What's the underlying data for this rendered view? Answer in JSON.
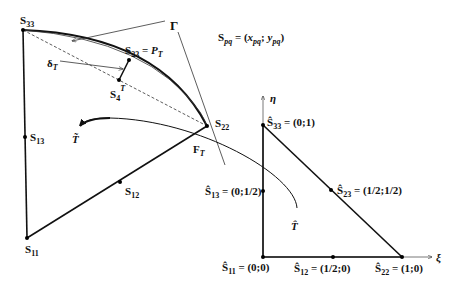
{
  "legend": {
    "formula_S": "S",
    "formula_sub": "pq",
    "formula_eq": " = (",
    "formula_x": "x",
    "formula_xsub": "pq",
    "formula_sep": "; ",
    "formula_y": "y",
    "formula_ysub": "pq",
    "formula_close": ")"
  },
  "physical": {
    "S33": {
      "base": "S",
      "sub": "33"
    },
    "S13": {
      "base": "S",
      "sub": "13"
    },
    "S11": {
      "base": "S",
      "sub": "11"
    },
    "S12": {
      "base": "S",
      "sub": "12"
    },
    "S22": {
      "base": "S",
      "sub": "22"
    },
    "S23": {
      "base": "S",
      "sub": "23",
      "eq": " = ",
      "P": "P",
      "Psub": "T"
    },
    "S4T": {
      "base": "S",
      "sub": "4",
      "sup": "T"
    },
    "deltaT": {
      "base": "δ",
      "sub": "T"
    },
    "gamma": "Γ",
    "FT": {
      "base": "F",
      "sub": "T"
    },
    "Ttilde": "T̃"
  },
  "reference": {
    "eta": "η",
    "xi": "ξ",
    "That": "T̂",
    "S33": {
      "base": "Ŝ",
      "sub": "33",
      "value": " = (0;1)"
    },
    "S13": {
      "base": "Ŝ",
      "sub": "13",
      "value": " = (0;1/2)"
    },
    "S23": {
      "base": "Ŝ",
      "sub": "23",
      "value": " = (1/2;1/2)"
    },
    "S11": {
      "base": "Ŝ",
      "sub": "11",
      "value": " = (0;0)"
    },
    "S12": {
      "base": "Ŝ",
      "sub": "12",
      "value": " = (1/2;0)"
    },
    "S22": {
      "base": "Ŝ",
      "sub": "22",
      "value": " = (1;0)"
    }
  }
}
